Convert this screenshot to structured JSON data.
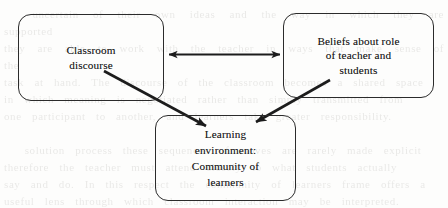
{
  "diagram": {
    "type": "concept-diagram",
    "background_note": "faint scanned page bleed-through behind diagram",
    "nodes": [
      {
        "id": "classroom-discourse",
        "label": "Classroom\ndiscourse",
        "shape": "rounded-rectangle",
        "x": 18,
        "y": 14,
        "width": 146,
        "height": 87
      },
      {
        "id": "beliefs",
        "label": "Beliefs about role\nof teacher and\nstudents",
        "shape": "rounded-rectangle",
        "x": 283,
        "y": 13,
        "width": 151,
        "height": 85
      },
      {
        "id": "learning-environment",
        "label": "Learning\nenvironment:\nCommunity of\nlearners",
        "shape": "rounded-rectangle",
        "x": 155,
        "y": 115,
        "width": 141,
        "height": 86
      }
    ],
    "connectors": [
      {
        "id": "classroom-beliefs",
        "from": "classroom-discourse",
        "to": "beliefs",
        "style": "double-headed-arrow",
        "orientation": "horizontal"
      },
      {
        "id": "classroom-learning",
        "from": "classroom-discourse",
        "to": "learning-environment",
        "style": "single-headed-arrow",
        "orientation": "diagonal-down-right"
      },
      {
        "id": "beliefs-learning",
        "from": "beliefs",
        "to": "learning-environment",
        "style": "single-headed-arrow",
        "orientation": "diagonal-down-left"
      }
    ],
    "colors": {
      "stroke": "#1c1c1c",
      "text": "#1a1a1a",
      "background": "#fdfdfc"
    }
  },
  "background_text": "  uncertain of their own ideas and the way in which they are supported\nthey are able to work with the teacher in ways that make sense of the\ntask at hand. The discourse of the classroom becomes a shared space\nin which meaning is negotiated rather than simply transmitted from\none participant to another, and learners take greater responsibility.\n\n  solution process these sequences of moves are rarely made explicit\ntherefore the teacher must attend closely to what students actually\nsay and do. In this respect the community of learners frame offers a\nuseful lens through which classroom interaction may be interpreted."
}
